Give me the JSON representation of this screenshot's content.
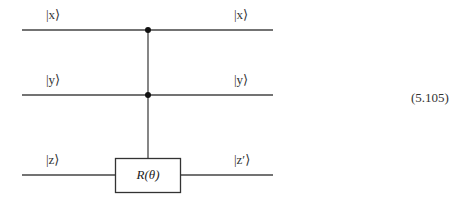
{
  "diagram": {
    "type": "quantum-circuit",
    "wires": [
      {
        "id": "x",
        "input_label": "|x⟩",
        "output_label": "|x⟩",
        "y": 30
      },
      {
        "id": "y",
        "input_label": "|y⟩",
        "output_label": "|y⟩",
        "y": 95
      },
      {
        "id": "z",
        "input_label": "|z⟩",
        "output_label": "|z′⟩",
        "y": 175
      }
    ],
    "controls": [
      {
        "wire": "x",
        "x": 148
      },
      {
        "wire": "y",
        "x": 148
      }
    ],
    "gate": {
      "target_wire": "z",
      "label": "R(θ)"
    },
    "equation_number": "(5.105)"
  }
}
